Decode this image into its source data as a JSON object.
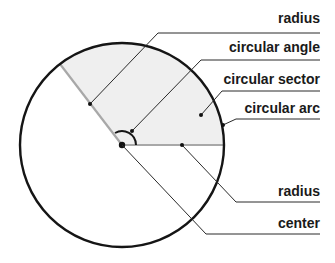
{
  "diagram": {
    "type": "circle-parts",
    "colors": {
      "circle_stroke": "#151515",
      "sector_fill": "#efefef",
      "radius_line": "#a8a8a8",
      "leader_line": "#2a2a2a"
    },
    "labels": [
      {
        "id": "radius_top",
        "text": "radius"
      },
      {
        "id": "circular_angle",
        "text": "circular angle"
      },
      {
        "id": "circular_sector",
        "text": "circular sector"
      },
      {
        "id": "circular_arc",
        "text": "circular arc"
      },
      {
        "id": "radius_bottom",
        "text": "radius"
      },
      {
        "id": "center",
        "text": "center"
      }
    ]
  }
}
